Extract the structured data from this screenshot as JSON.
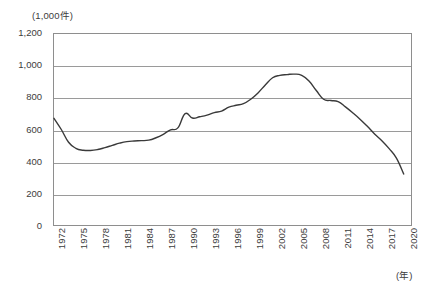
{
  "chart_data": {
    "type": "line",
    "title": "",
    "subtitle": "",
    "xlabel": "(年)",
    "ylabel": "(1,000件)",
    "y_unit_label": "(1,000件)",
    "x_unit_label": "(年)",
    "grid": true,
    "legend": false,
    "legend_position": "none",
    "ylim": [
      0,
      1200
    ],
    "y_ticks": [
      "0",
      "200",
      "400",
      "600",
      "800",
      "1,000",
      "1,200"
    ],
    "y_tick_values": [
      0,
      200,
      400,
      600,
      800,
      1000,
      1200
    ],
    "xlim": [
      1972,
      2021
    ],
    "x_tick_labels": [
      "1972",
      "1975",
      "1978",
      "1981",
      "1984",
      "1987",
      "1990",
      "1993",
      "1996",
      "1999",
      "2002",
      "2005",
      "2008",
      "2011",
      "2014",
      "2017",
      "2020"
    ],
    "x_tick_values": [
      1972,
      1975,
      1978,
      1981,
      1984,
      1987,
      1990,
      1993,
      1996,
      1999,
      2002,
      2005,
      2008,
      2011,
      2014,
      2017,
      2020
    ],
    "line_color": "#3a3a3a",
    "series": [
      {
        "name": "件数",
        "x": [
          1972,
          1973,
          1974,
          1975,
          1976,
          1977,
          1978,
          1979,
          1980,
          1981,
          1982,
          1983,
          1984,
          1985,
          1986,
          1987,
          1988,
          1989,
          1990,
          1991,
          1992,
          1993,
          1994,
          1995,
          1996,
          1997,
          1998,
          1999,
          2000,
          2001,
          2002,
          2003,
          2004,
          2005,
          2006,
          2007,
          2008,
          2009,
          2010,
          2011,
          2012,
          2013,
          2014,
          2015,
          2016,
          2017,
          2018,
          2019,
          2020
        ],
        "values": [
          670,
          600,
          520,
          482,
          470,
          468,
          474,
          486,
          500,
          514,
          524,
          528,
          530,
          533,
          548,
          570,
          598,
          610,
          700,
          672,
          680,
          690,
          706,
          716,
          740,
          752,
          762,
          790,
          830,
          880,
          925,
          940,
          945,
          948,
          940,
          905,
          845,
          790,
          782,
          775,
          742,
          705,
          665,
          620,
          572,
          530,
          480,
          420,
          320
        ]
      }
    ]
  }
}
